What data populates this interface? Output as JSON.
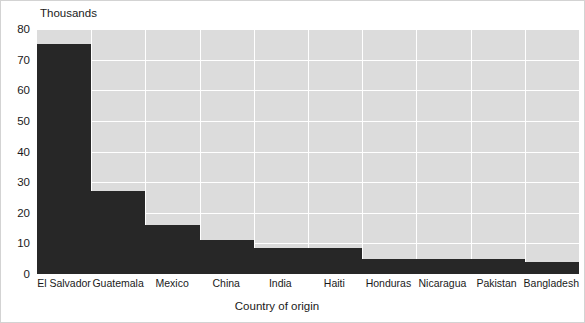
{
  "chart_data": {
    "type": "bar",
    "title": "",
    "subtitle": "",
    "xlabel": "Country of origin",
    "ylabel": "Thousands",
    "y_unit_caption": "Thousands",
    "categories": [
      "El Salvador",
      "Guatemala",
      "Mexico",
      "China",
      "India",
      "Haiti",
      "Honduras",
      "Nicaragua",
      "Pakistan",
      "Bangladesh"
    ],
    "values": [
      75,
      27,
      16,
      11,
      8.5,
      8.5,
      5,
      5,
      5,
      4
    ],
    "ylim": [
      0,
      80
    ],
    "yticks": [
      0,
      10,
      20,
      30,
      40,
      50,
      60,
      70,
      80
    ],
    "ytick_labels": [
      "0",
      "10",
      "20",
      "30",
      "40",
      "50",
      "60",
      "70",
      "80"
    ],
    "grid": true,
    "grid_axis": "both",
    "legend": false,
    "legend_position": "none",
    "colors": {
      "bar": "#272727",
      "plot_background": "#dcdcdc",
      "gridline": "#ffffff",
      "figure_background": "#ffffff",
      "frame_border": "#d3d3d3",
      "text": "#1a1a1a"
    }
  }
}
